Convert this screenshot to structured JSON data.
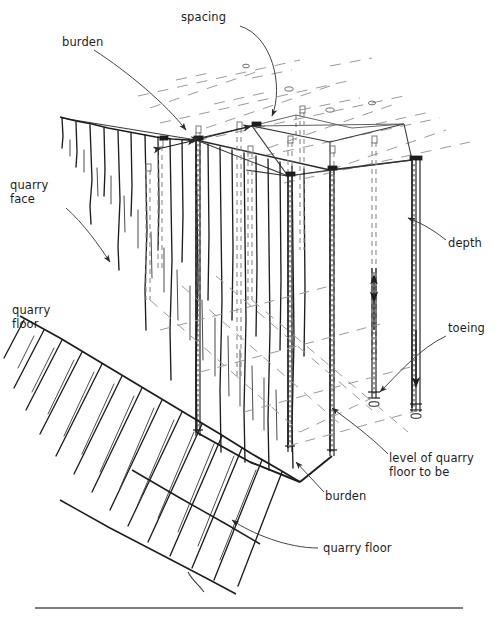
{
  "figure": {
    "background_color": "#ffffff",
    "ink_color": "#1d1d1d",
    "line_color": "#3a3a3a",
    "dashed_color": "#8a8a8a",
    "width": 495,
    "height": 619
  },
  "labels": {
    "spacing": "spacing",
    "burden_top": "burden",
    "quarry_face": "quarry\nface",
    "quarry_face_line1": "quarry",
    "quarry_face_line2": "face",
    "quarry_floor_left": "quarry\nfloor",
    "quarry_floor_left_line1": "quarry",
    "quarry_floor_left_line2": "floor",
    "depth": "depth",
    "toeing": "toeing",
    "level_of_quarry_floor_to_be_line1": "level of quarry",
    "level_of_quarry_floor_to_be_line2": "floor to be",
    "burden_bottom": "burden",
    "quarry_floor_bottom": "quarry floor"
  },
  "diagram_elements": {
    "top_bench_surface": "dashed grid plane of the bench top",
    "quarry_face": "hatched vertical rock face at left",
    "quarry_floor": "hatched sloping floor at bottom left",
    "drill_holes": "vertical dashed and solid blast holes",
    "toe_arrows": "downward arrows showing subdrill / toeing",
    "future_floor_plane": "dashed plane marking level of quarry floor to be",
    "baseline_rule": "horizontal rule at bottom of figure"
  },
  "leader_lines": [
    {
      "label": "spacing",
      "points": "curve from text down-left to hole row on bench top"
    },
    {
      "label": "burden_top",
      "points": "curve from text down-right to bench crest"
    },
    {
      "label": "quarry_face",
      "points": "curve from text down-right onto the rock face"
    },
    {
      "label": "depth",
      "points": "curve from text left to drill hole shaft"
    },
    {
      "label": "toeing",
      "points": "curve from text down-left to hole toe"
    },
    {
      "label": "level_of_quarry_floor_to_be",
      "points": "curve from text up-left to dashed floor plane"
    },
    {
      "label": "burden_bottom",
      "points": "straight line from text up-left to floor crest"
    },
    {
      "label": "quarry_floor_bottom",
      "points": "line from text left to sloping floor"
    }
  ]
}
